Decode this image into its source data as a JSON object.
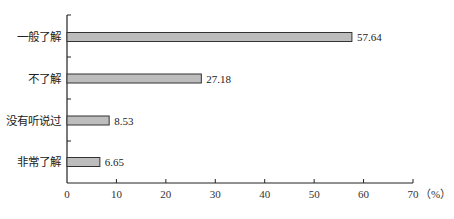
{
  "chart_data": {
    "type": "bar",
    "orientation": "horizontal",
    "title": "",
    "xlabel": "(%)",
    "ylabel": "",
    "categories": [
      "一般了解",
      "不了解",
      "没有听说过",
      "非常了解"
    ],
    "values": [
      57.64,
      27.18,
      8.53,
      6.65
    ],
    "value_labels": [
      "57.64",
      "27.18",
      "8.53",
      "6.65"
    ],
    "xlim": [
      0,
      70
    ],
    "xticks": [
      0,
      10,
      20,
      30,
      40,
      50,
      60,
      70
    ],
    "xtick_labels": [
      "0",
      "10",
      "20",
      "30",
      "40",
      "50",
      "60",
      "70"
    ],
    "x_unit_label": "（%）",
    "grid": false,
    "legend": null,
    "bar_color": "#bdbdbd",
    "bar_edge_color": "#333333"
  }
}
